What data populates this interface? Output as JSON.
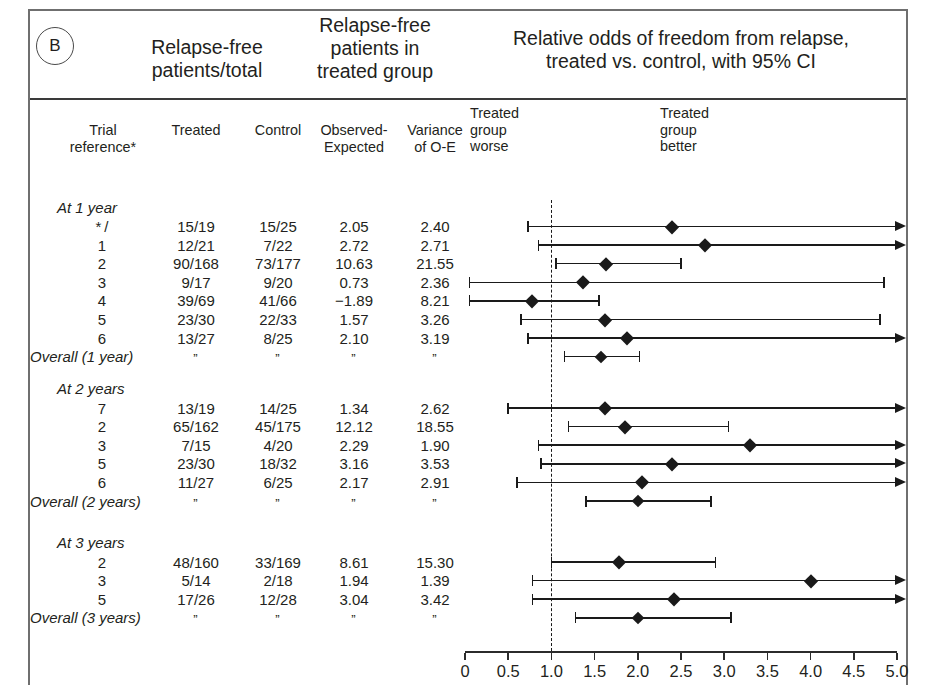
{
  "panel": {
    "letter": "B"
  },
  "headers": {
    "big": [
      {
        "id": "relapse_free_total",
        "text": "Relapse-free\npatients/total"
      },
      {
        "id": "relapse_free_treated",
        "text": "Relapse-free\npatients in\ntreated group"
      },
      {
        "id": "relative_odds",
        "text": "Relative odds of freedom from relapse,\ntreated vs. control, with 95% CI"
      }
    ],
    "columns": [
      {
        "id": "trial_reference",
        "text": "Trial\nreference*"
      },
      {
        "id": "treated",
        "text": "Treated"
      },
      {
        "id": "control",
        "text": "Control"
      },
      {
        "id": "observed_expected",
        "text": "Observed-\nExpected"
      },
      {
        "id": "variance",
        "text": "Variance\nof O-E"
      }
    ],
    "plot_sides": [
      {
        "id": "treated_group_worse",
        "text": "Treated\ngroup\nworse"
      },
      {
        "id": "treated_group_better",
        "text": "Treated\ngroup\nbetter"
      }
    ]
  },
  "axis": {
    "min": 0,
    "max": 5.0,
    "null_value": 1.0,
    "tick_step": 0.5,
    "ticks": [
      "0",
      "0.5",
      "1.0",
      "1.5",
      "2.0",
      "2.5",
      "3.0",
      "3.5",
      "4.0",
      "4.5",
      "5.0"
    ]
  },
  "ditto": "”",
  "chart_data": {
    "type": "forest",
    "title": "Relative odds of freedom from relapse, treated vs. control, with 95% CI",
    "xlabel": "Odds ratio",
    "xlim": [
      0,
      5.0
    ],
    "null_line": 1.0,
    "grid": false,
    "groups": [
      {
        "label": "At 1 year",
        "rows": [
          {
            "ref": "* /",
            "treated": "15/19",
            "control": "15/25",
            "o_minus_e": "2.05",
            "variance": "2.40",
            "or": 2.4,
            "lo": 0.73,
            "hi": 5.0,
            "hi_open": true
          },
          {
            "ref": "1",
            "treated": "12/21",
            "control": "7/22",
            "o_minus_e": "2.72",
            "variance": "2.71",
            "or": 2.78,
            "lo": 0.85,
            "hi": 5.0,
            "hi_open": true
          },
          {
            "ref": "2",
            "treated": "90/168",
            "control": "73/177",
            "o_minus_e": "10.63",
            "variance": "21.55",
            "or": 1.63,
            "lo": 1.05,
            "hi": 2.5,
            "hi_open": false
          },
          {
            "ref": "3",
            "treated": "9/17",
            "control": "9/20",
            "o_minus_e": "0.73",
            "variance": "2.36",
            "or": 1.37,
            "lo": 0.05,
            "hi": 4.85,
            "hi_open": false
          },
          {
            "ref": "4",
            "treated": "39/69",
            "control": "41/66",
            "o_minus_e": "−1.89",
            "variance": "8.21",
            "or": 0.78,
            "lo": 0.05,
            "hi": 1.55,
            "hi_open": false
          },
          {
            "ref": "5",
            "treated": "23/30",
            "control": "22/33",
            "o_minus_e": "1.57",
            "variance": "3.26",
            "or": 1.62,
            "lo": 0.65,
            "hi": 4.8,
            "hi_open": false
          },
          {
            "ref": "6",
            "treated": "13/27",
            "control": "8/25",
            "o_minus_e": "2.10",
            "variance": "3.19",
            "or": 1.88,
            "lo": 0.73,
            "hi": 5.0,
            "hi_open": true
          }
        ],
        "overall": {
          "label": "Overall (1 year)",
          "or": 1.57,
          "lo": 1.15,
          "hi": 2.02,
          "hi_open": false
        }
      },
      {
        "label": "At 2 years",
        "rows": [
          {
            "ref": "7",
            "treated": "13/19",
            "control": "14/25",
            "o_minus_e": "1.34",
            "variance": "2.62",
            "or": 1.62,
            "lo": 0.5,
            "hi": 5.0,
            "hi_open": true
          },
          {
            "ref": "2",
            "treated": "65/162",
            "control": "45/175",
            "o_minus_e": "12.12",
            "variance": "18.55",
            "or": 1.85,
            "lo": 1.2,
            "hi": 3.05,
            "hi_open": false
          },
          {
            "ref": "3",
            "treated": "7/15",
            "control": "4/20",
            "o_minus_e": "2.29",
            "variance": "1.90",
            "or": 3.3,
            "lo": 0.85,
            "hi": 5.0,
            "hi_open": true
          },
          {
            "ref": "5",
            "treated": "23/30",
            "control": "18/32",
            "o_minus_e": "3.16",
            "variance": "3.53",
            "or": 2.4,
            "lo": 0.88,
            "hi": 5.0,
            "hi_open": true
          },
          {
            "ref": "6",
            "treated": "11/27",
            "control": "6/25",
            "o_minus_e": "2.17",
            "variance": "2.91",
            "or": 2.05,
            "lo": 0.6,
            "hi": 5.0,
            "hi_open": true
          }
        ],
        "overall": {
          "label": "Overall (2 years)",
          "or": 2.0,
          "lo": 1.4,
          "hi": 2.85,
          "hi_open": false
        }
      },
      {
        "label": "At 3 years",
        "rows": [
          {
            "ref": "2",
            "treated": "48/160",
            "control": "33/169",
            "o_minus_e": "8.61",
            "variance": "15.30",
            "or": 1.78,
            "lo": 1.0,
            "hi": 2.9,
            "hi_open": false
          },
          {
            "ref": "3",
            "treated": "5/14",
            "control": "2/18",
            "o_minus_e": "1.94",
            "variance": "1.39",
            "or": 4.0,
            "lo": 0.78,
            "hi": 5.0,
            "hi_open": true
          },
          {
            "ref": "5",
            "treated": "17/26",
            "control": "12/28",
            "o_minus_e": "3.04",
            "variance": "3.42",
            "or": 2.42,
            "lo": 0.78,
            "hi": 5.0,
            "hi_open": true
          }
        ],
        "overall": {
          "label": "Overall (3 years)",
          "or": 2.0,
          "lo": 1.28,
          "hi": 3.08,
          "hi_open": false
        }
      }
    ]
  }
}
